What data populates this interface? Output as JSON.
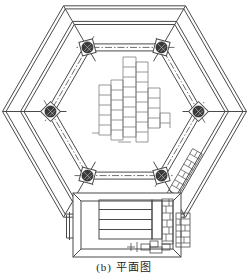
{
  "figure": {
    "caption": "(b) 平面图"
  },
  "drawing": {
    "icons": {
      "column_symbol": "hatched-column-icon",
      "masonry_symbol": "brick-hatch-icon",
      "axis_symbol": "dashdot-centerline-icon"
    },
    "colors": {
      "background": "#ffffff",
      "line": "#4a4a4a",
      "light_line": "#7d7d7d",
      "column_fill": "#3a3a3a",
      "column_hatch": "#c8c8c8",
      "caption_text": "#1c1c1c"
    }
  }
}
